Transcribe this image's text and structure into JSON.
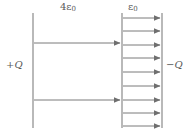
{
  "figure": {
    "background_color": "#ffffff",
    "line_color": "#7a7a7a",
    "text_color": "#5a5a5a",
    "width": 187,
    "height": 134,
    "labels": {
      "permittivity_left": "4ε",
      "permittivity_left_sub": "0",
      "permittivity_right": "ε",
      "permittivity_right_sub": "0",
      "charge_left": "+Q",
      "charge_right": "−Q"
    },
    "geometry": {
      "left_plate_x": 33,
      "boundary_x": 122,
      "right_plate_x": 162,
      "plate_top_y": 13,
      "plate_bottom_y": 128
    },
    "field_arrows_left_region": [
      {
        "x1": 34,
        "y": 43,
        "x2": 121
      },
      {
        "x1": 34,
        "y": 100,
        "x2": 121
      }
    ],
    "field_arrows_right_region": [
      {
        "x1": 123,
        "y": 18,
        "x2": 161
      },
      {
        "x1": 123,
        "y": 31,
        "x2": 161
      },
      {
        "x1": 123,
        "y": 45,
        "x2": 161
      },
      {
        "x1": 123,
        "y": 58,
        "x2": 161
      },
      {
        "x1": 123,
        "y": 72,
        "x2": 161
      },
      {
        "x1": 123,
        "y": 86,
        "x2": 161
      },
      {
        "x1": 123,
        "y": 100,
        "x2": 161
      },
      {
        "x1": 123,
        "y": 113,
        "x2": 161
      },
      {
        "x1": 123,
        "y": 126,
        "x2": 161
      }
    ]
  }
}
